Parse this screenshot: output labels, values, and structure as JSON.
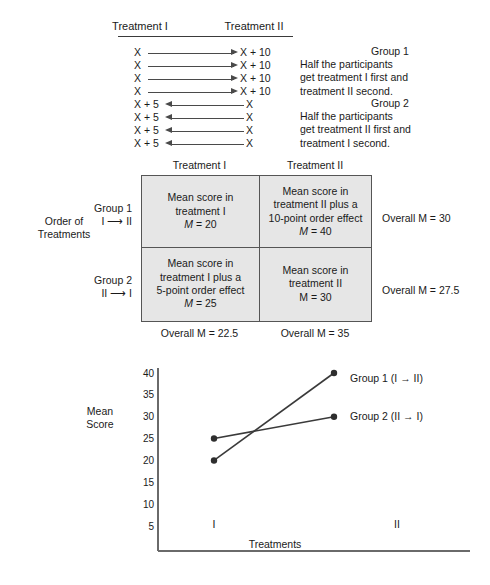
{
  "figure": {
    "arrow_diagram": {
      "column_headers": [
        "Treatment I",
        "Treatment II"
      ],
      "group1": {
        "rows": [
          {
            "left": "X",
            "right": "X + 10",
            "direction": "right"
          },
          {
            "left": "X",
            "right": "X + 10",
            "direction": "right"
          },
          {
            "left": "X",
            "right": "X + 10",
            "direction": "right"
          },
          {
            "left": "X",
            "right": "X + 10",
            "direction": "right"
          }
        ],
        "note_title": "Group 1",
        "note_line1": "Half the participants",
        "note_line2": "get treatment I first and",
        "note_line3": "treatment II second."
      },
      "group2": {
        "rows": [
          {
            "left": "X + 5",
            "right": "X",
            "direction": "left"
          },
          {
            "left": "X + 5",
            "right": "X",
            "direction": "left"
          },
          {
            "left": "X + 5",
            "right": "X",
            "direction": "left"
          },
          {
            "left": "X + 5",
            "right": "X",
            "direction": "left"
          }
        ],
        "note_title": "Group 2",
        "note_line1": "Half the participants",
        "note_line2": "get treatment II first and",
        "note_line3": "treatment I second."
      }
    },
    "matrix": {
      "axis_label_line1": "Order of",
      "axis_label_line2": "Treatments",
      "column_headers": [
        "Treatment I",
        "Treatment II"
      ],
      "row1": {
        "label_line1": "Group 1",
        "label_line2": "I ⟶ II",
        "cell1_line1": "Mean score in",
        "cell1_line2": "treatment I",
        "cell1_stat_prefix": "M",
        "cell1_stat_value": " = 20",
        "cell2_line1": "Mean score in",
        "cell2_line2": "treatment II plus a",
        "cell2_line3": "10-point order effect",
        "cell2_stat_prefix": "M",
        "cell2_stat_value": " = 40",
        "overall": "Overall M = 30"
      },
      "row2": {
        "label_line1": "Group 2",
        "label_line2": "II ⟶ I",
        "cell1_line1": "Mean score in",
        "cell1_line2": "treatment I plus a",
        "cell1_line3": "5-point order effect",
        "cell1_stat_prefix": "M",
        "cell1_stat_value": " = 25",
        "cell2_line1": "Mean score in",
        "cell2_line2": "treatment II",
        "cell2_stat_prefix": "M",
        "cell2_stat_value": " = 30",
        "overall": "Overall M = 27.5"
      },
      "col_overall_1": "Overall M = 22.5",
      "col_overall_2": "Overall M = 35"
    }
  },
  "chart_data": {
    "type": "line",
    "title": "",
    "xlabel": "Treatments",
    "ylabel_line1": "Mean",
    "ylabel_line2": "Score",
    "categories": [
      "I",
      "II"
    ],
    "x": [
      "I",
      "II"
    ],
    "yticks": [
      40,
      35,
      30,
      25,
      20,
      15,
      10,
      5
    ],
    "ylim": [
      0,
      42.5
    ],
    "grid": false,
    "legend_position": "right-of-endpoint",
    "series": [
      {
        "name": "Group 1 (I → II)",
        "values": [
          20,
          40
        ]
      },
      {
        "name": "Group 2 (II → I)",
        "values": [
          25,
          30
        ]
      }
    ]
  }
}
